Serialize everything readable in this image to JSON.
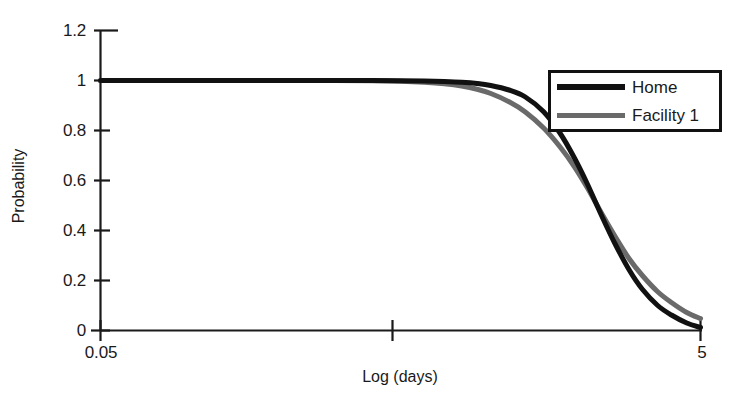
{
  "chart_data": {
    "type": "line",
    "title": "",
    "xlabel": "Log (days)",
    "ylabel": "Probability",
    "grid": false,
    "legend_position": "top-right",
    "xlim": [
      0.05,
      5
    ],
    "ylim": [
      0,
      1.2
    ],
    "x_tick_labels": [
      "0.05",
      "5"
    ],
    "x_tick_unlabeled_count": 1,
    "y_tick_labels": [
      "0",
      "0.2",
      "0.4",
      "0.6",
      "0.8",
      "1",
      "1.2"
    ],
    "y_ticks": [
      0,
      0.2,
      0.4,
      0.6,
      0.8,
      1,
      1.2
    ],
    "x": [
      0.05,
      0.12,
      0.2,
      0.3,
      0.4,
      0.5,
      0.6,
      0.7,
      0.8,
      0.9,
      1.0,
      1.15,
      1.3,
      1.5,
      1.7,
      1.9,
      2.1,
      2.35,
      2.6,
      2.9,
      3.2,
      3.6,
      4.0,
      4.5,
      5.0
    ],
    "series": [
      {
        "name": "Home",
        "color": "#111111",
        "values": [
          1.0,
          1.0,
          1.0,
          1.0,
          1.0,
          0.999,
          0.998,
          0.996,
          0.993,
          0.988,
          0.98,
          0.962,
          0.935,
          0.875,
          0.79,
          0.69,
          0.585,
          0.455,
          0.345,
          0.24,
          0.165,
          0.1,
          0.062,
          0.03,
          0.012
        ]
      },
      {
        "name": "Facility 1",
        "color": "#6a6a6a",
        "values": [
          1.0,
          1.0,
          1.0,
          1.0,
          0.999,
          0.997,
          0.993,
          0.987,
          0.978,
          0.965,
          0.948,
          0.915,
          0.875,
          0.81,
          0.735,
          0.655,
          0.57,
          0.465,
          0.375,
          0.285,
          0.22,
          0.155,
          0.112,
          0.072,
          0.048
        ]
      }
    ],
    "legend": [
      {
        "label": "Home",
        "color": "#111111",
        "style": "solid-thick"
      },
      {
        "label": "Facility 1",
        "color": "#6a6a6a",
        "style": "solid"
      }
    ],
    "annotations": [
      "Two sigmoid survival-style curves both starting at probability 1.0 and decaying toward 0 across the log-days axis.",
      "Facility 1 declines slightly earlier in the mid range and crosses above Home near probability 0.5, ending at a higher tail value (~0.05) than Home (~0.01)."
    ],
    "axis_color": "#1a1a1a"
  }
}
